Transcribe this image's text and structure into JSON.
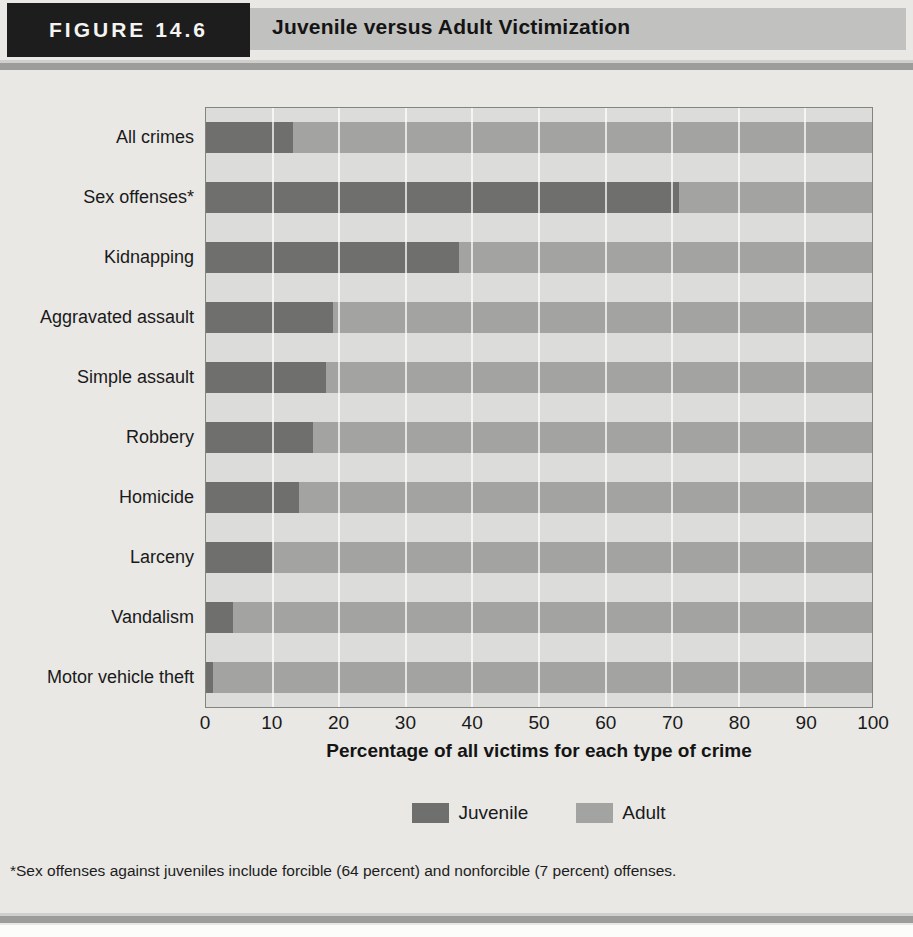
{
  "figure": {
    "label": "FIGURE 14.6",
    "title": "Juvenile versus Adult Victimization",
    "footnote": "*Sex offenses against juveniles include forcible (64 percent) and nonforcible (7 percent) offenses."
  },
  "colors": {
    "juvenile": "#6f6f6d",
    "adult": "#a3a3a1",
    "plot_bg": "#dcdcda",
    "page_bg": "#e9e8e5",
    "header_band": "#c1c1bf",
    "header_box": "#1d1d1d",
    "rule": "#9c9c9a",
    "gridline": "#ffffff"
  },
  "chart_data": {
    "type": "bar",
    "orientation": "horizontal",
    "stacked": true,
    "title": "Juvenile versus Adult Victimization",
    "categories": [
      "All crimes",
      "Sex offenses*",
      "Kidnapping",
      "Aggravated assault",
      "Simple assault",
      "Robbery",
      "Homicide",
      "Larceny",
      "Vandalism",
      "Motor vehicle theft"
    ],
    "series": [
      {
        "name": "Juvenile",
        "values": [
          13,
          71,
          38,
          19,
          18,
          16,
          14,
          10,
          4,
          1
        ]
      },
      {
        "name": "Adult",
        "values": [
          87,
          29,
          62,
          81,
          82,
          84,
          86,
          90,
          96,
          99
        ]
      }
    ],
    "xlabel": "Percentage of all victims for each type of crime",
    "ylabel": "",
    "x_ticks": [
      0,
      10,
      20,
      30,
      40,
      50,
      60,
      70,
      80,
      90,
      100
    ],
    "xlim": [
      0,
      100
    ],
    "grid": true,
    "legend": [
      "Juvenile",
      "Adult"
    ],
    "legend_position": "bottom"
  }
}
